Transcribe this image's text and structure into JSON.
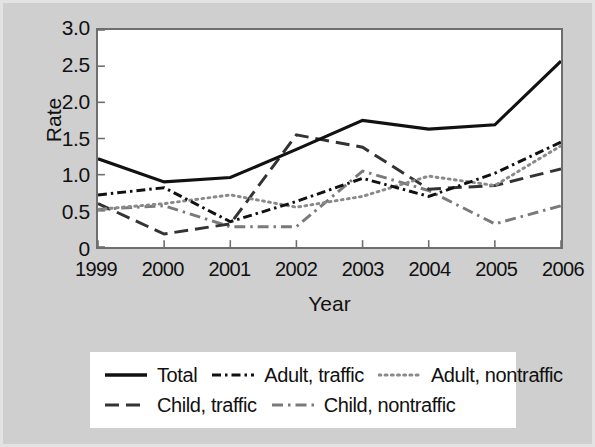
{
  "chart_data": {
    "type": "line",
    "title": "",
    "xlabel": "Year",
    "ylabel": "Rate",
    "categories": [
      "1999",
      "2000",
      "2001",
      "2002",
      "2003",
      "2004",
      "2005",
      "2006"
    ],
    "x": [
      1999,
      2000,
      2001,
      2002,
      2003,
      2004,
      2005,
      2006
    ],
    "ylim": [
      0,
      3.0
    ],
    "xlim": [
      1999,
      2006
    ],
    "yticks": [
      "3.0",
      "2.5",
      "2.0",
      "1.5",
      "1.0",
      "0.5",
      "0"
    ],
    "ytick_values": [
      3.0,
      2.5,
      2.0,
      1.5,
      1.0,
      0.5,
      0
    ],
    "grid": false,
    "legend_position": "bottom",
    "series": [
      {
        "name": "Total",
        "style": "solid",
        "color": "#111111",
        "values": [
          1.22,
          0.9,
          0.96,
          1.35,
          1.75,
          1.63,
          1.69,
          2.57
        ]
      },
      {
        "name": "Adult, traffic",
        "style": "dash-dot-dash",
        "color": "#111111",
        "values": [
          0.72,
          0.82,
          0.35,
          0.63,
          0.95,
          0.7,
          1.02,
          1.45
        ]
      },
      {
        "name": "Adult, nontraffic",
        "style": "dotted",
        "color": "#8a8a8a",
        "values": [
          0.52,
          0.6,
          0.72,
          0.55,
          0.7,
          0.98,
          0.85,
          1.4
        ]
      },
      {
        "name": "Child, traffic",
        "style": "long-dash",
        "color": "#333333",
        "values": [
          0.6,
          0.18,
          0.32,
          1.55,
          1.38,
          0.8,
          0.85,
          1.08
        ]
      },
      {
        "name": "Child, nontraffic",
        "style": "dash-dot",
        "color": "#7a7a7a",
        "values": [
          0.52,
          0.57,
          0.28,
          0.28,
          1.05,
          0.78,
          0.32,
          0.57
        ]
      }
    ]
  },
  "axes": {
    "ylabel": "Rate",
    "xlabel": "Year",
    "yticks": [
      "3.0",
      "2.5",
      "2.0",
      "1.5",
      "1.0",
      "0.5",
      "0"
    ],
    "xticks": [
      "1999",
      "2000",
      "2001",
      "2002",
      "2003",
      "2004",
      "2005",
      "2006"
    ]
  },
  "legend": {
    "rows": [
      [
        {
          "label": "Total",
          "style": "solid"
        },
        {
          "label": "Adult, traffic",
          "style": "dash-dot-dash"
        },
        {
          "label": "Adult, nontraffic",
          "style": "dotted"
        }
      ],
      [
        {
          "label": "Child, traffic",
          "style": "long-dash"
        },
        {
          "label": "Child, nontraffic",
          "style": "dash-dot"
        }
      ]
    ]
  },
  "colors": {
    "figure_background": "#cfcfcf",
    "plot_background": "#ffffff",
    "axis": "#6e6e6e",
    "text": "#111111"
  }
}
